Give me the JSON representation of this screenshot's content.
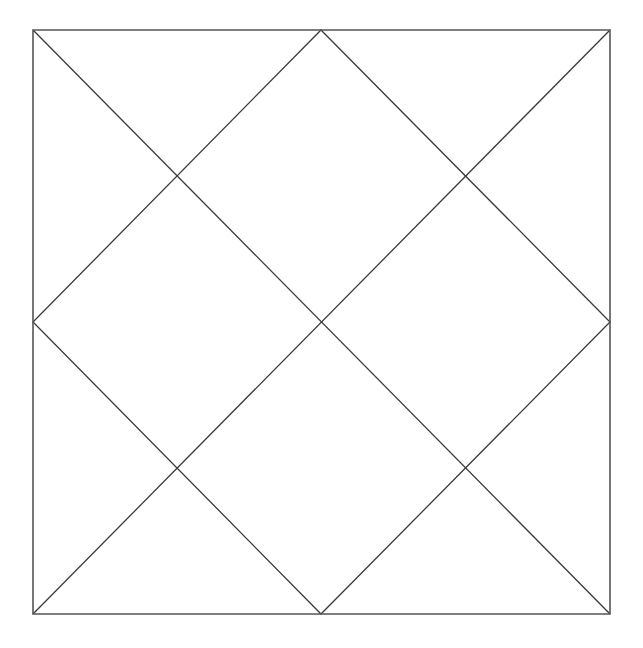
{
  "canvas": {
    "width": 643,
    "height": 648,
    "background_color": "#ffffff"
  },
  "figure": {
    "stroke_color": "#3a3a3a",
    "frame_stroke_color": "#555555",
    "stroke_width": 1.3,
    "frame_stroke_width": 1.6
  },
  "geometry": {
    "square": {
      "left": 33,
      "top": 30,
      "right": 610,
      "bottom": 614,
      "width": 577,
      "height": 584
    },
    "corners": {
      "top_left": [
        33,
        30
      ],
      "top_right": [
        610,
        30
      ],
      "bottom_right": [
        610,
        614
      ],
      "bottom_left": [
        33,
        614
      ]
    },
    "edge_midpoints": {
      "top": [
        321,
        30
      ],
      "right": [
        610,
        322
      ],
      "bottom": [
        321,
        614
      ],
      "left": [
        33,
        322
      ]
    },
    "intersections": {
      "center": [
        321,
        322
      ],
      "upper_left": [
        177,
        177
      ],
      "upper_right": [
        465,
        177
      ],
      "lower_left": [
        177,
        468
      ],
      "lower_right": [
        465,
        468
      ]
    }
  },
  "chart_data": {
    "type": "diagram",
    "title": "",
    "shapes": [
      {
        "name": "outer-square",
        "kind": "polygon",
        "closed": true,
        "points": [
          [
            33,
            30
          ],
          [
            610,
            30
          ],
          [
            610,
            614
          ],
          [
            33,
            614
          ]
        ]
      },
      {
        "name": "inscribed-diamond",
        "kind": "polygon",
        "closed": true,
        "points": [
          [
            321,
            30
          ],
          [
            610,
            322
          ],
          [
            321,
            614
          ],
          [
            33,
            322
          ]
        ]
      },
      {
        "name": "diagonal-top-left-to-bottom-right",
        "kind": "line",
        "closed": false,
        "points": [
          [
            33,
            30
          ],
          [
            610,
            614
          ]
        ]
      },
      {
        "name": "diagonal-top-right-to-bottom-left",
        "kind": "line",
        "closed": false,
        "points": [
          [
            610,
            30
          ],
          [
            33,
            614
          ]
        ]
      }
    ],
    "grid": false,
    "legend": null,
    "xlabel": "",
    "ylabel": "",
    "annotations": []
  }
}
